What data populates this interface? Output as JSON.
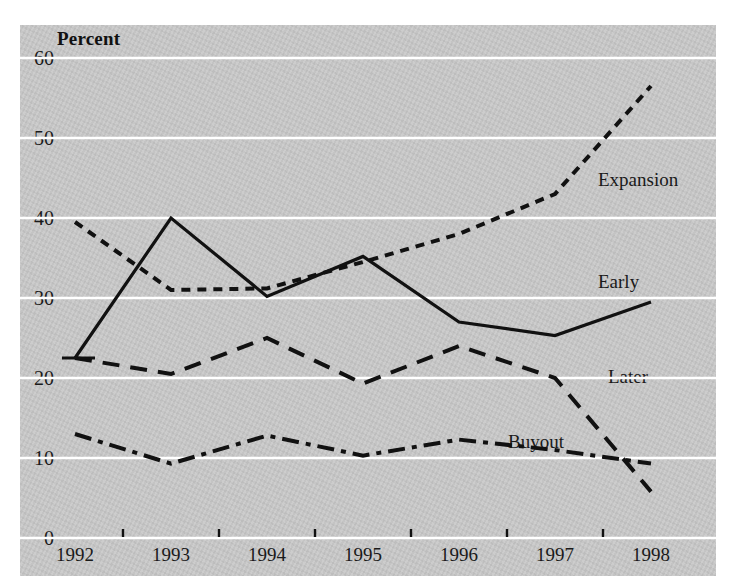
{
  "chart_data": {
    "type": "line",
    "title": "Percent",
    "xlabel": "",
    "ylabel": "Percent",
    "grid": true,
    "legend_position": "inline-right",
    "x": [
      1992,
      1993,
      1994,
      1995,
      1996,
      1997,
      1998
    ],
    "categories": [
      "1992",
      "1993",
      "1994",
      "1995",
      "1996",
      "1997",
      "1998"
    ],
    "xlim": [
      1992,
      1998
    ],
    "ylim": [
      0,
      60
    ],
    "yticks": [
      0,
      10,
      20,
      30,
      40,
      50,
      60
    ],
    "ytick_labels": [
      "0",
      "10",
      "20",
      "30",
      "40",
      "50",
      "60"
    ],
    "series": [
      {
        "name": "Expansion",
        "style": "dotted",
        "color": "#111111",
        "values": [
          39.5,
          31.0,
          31.2,
          34.5,
          38.0,
          43.0,
          56.5
        ]
      },
      {
        "name": "Early",
        "style": "solid",
        "color": "#111111",
        "values": [
          22.5,
          40.0,
          30.2,
          35.2,
          27.0,
          25.3,
          29.5
        ]
      },
      {
        "name": "Later",
        "style": "dashed",
        "color": "#111111",
        "values": [
          22.5,
          20.5,
          25.0,
          19.3,
          24.0,
          20.0,
          5.8
        ]
      },
      {
        "name": "Buyout",
        "style": "dashdot",
        "color": "#111111",
        "values": [
          13.0,
          9.3,
          12.8,
          10.3,
          12.3,
          11.0,
          9.3
        ]
      }
    ]
  },
  "axis": {
    "y_title": "Percent",
    "y_tick_labels": [
      "60",
      "50",
      "40",
      "30",
      "20",
      "10",
      "0"
    ],
    "x_tick_labels": [
      "1992",
      "1993",
      "1994",
      "1995",
      "1996",
      "1997",
      "1998"
    ]
  },
  "series_labels": [
    {
      "text": "Expansion",
      "x": 598,
      "y": 170
    },
    {
      "text": "Early",
      "x": 598,
      "y": 272
    },
    {
      "text": "Later",
      "x": 608,
      "y": 367
    },
    {
      "text": "Buyout",
      "x": 508,
      "y": 432
    }
  ],
  "colors": {
    "panel": "#c9c9c9",
    "gridline": "#ffffff",
    "ink": "#111111",
    "background": "#ffffff"
  }
}
